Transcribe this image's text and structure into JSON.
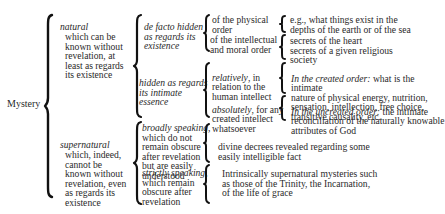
{
  "root": {
    "label": "Mystery"
  },
  "branches": [
    {
      "title": "natural",
      "desc": "which can be\nknown without\nrevelation, at\nleast as regards\nits existence",
      "children": [
        {
          "title": "de facto hidden\nas regards its\nexistence",
          "children": [
            {
              "label": "of the physical\norder",
              "example": "e.g., what things exist in the\ndepths of the earth or of the sea"
            },
            {
              "label": "of the intellectual\nand moral order",
              "example": "secrets of the heart\nsecrets of a given religious\nsociety"
            }
          ]
        },
        {
          "title": "hidden as regards\nits intimate\nessence",
          "children": [
            {
              "label_italic": "relatively",
              "label_rest": ", in\nrelation to the\nhuman intellect",
              "example_italic": "In the created order:",
              "example_rest": " what is the intimate\nnature of physical energy, nutrition,\nsensation, intellection, free choice,\ntransitive causality, etc."
            },
            {
              "label_italic": "absolutely",
              "label_rest": ", for any\ncreated intellect\nwhatsoever",
              "example_italic": "In the uncreated order:",
              "example_rest": " the intimate\nreconciliation of the naturally knowable\nattributes of God"
            }
          ]
        }
      ]
    },
    {
      "title": "supernatural",
      "desc": "which, indeed,\ncannot be\nknown without\nrevelation, even\nas regards its\nexistence",
      "children": [
        {
          "title_italic": "broadly speaking,",
          "title_rest": "which do not\nremain obscure\nafter revelation\nbut are easily\nunderstood",
          "example": "divine decrees revealed regarding some\neasily intelligible fact"
        },
        {
          "title_italic": "strictly speaking,",
          "title_rest": "which remain\nobscure after\nrevelation",
          "example": "Intrinsically supernatural mysteries such\nas those of the Trinity, the Incarnation,\nof the life of grace"
        }
      ]
    }
  ]
}
